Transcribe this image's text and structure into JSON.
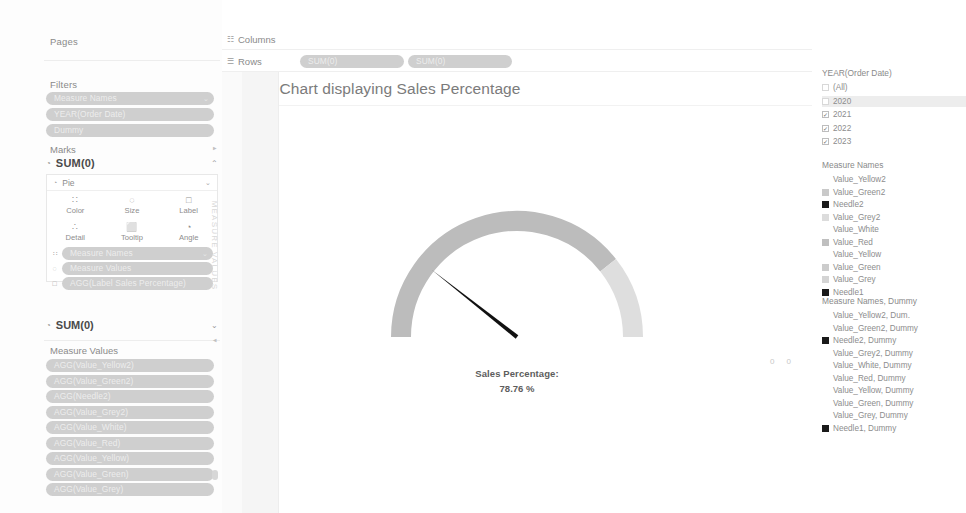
{
  "left_pane": {
    "pages": {
      "label": "Pages"
    },
    "filters": {
      "label": "Filters",
      "pills": [
        {
          "label": "Measure Names",
          "caret": "⌄"
        },
        {
          "label": "YEAR(Order Date)",
          "caret": ""
        },
        {
          "label": "Dummy",
          "caret": ""
        }
      ]
    },
    "marks": {
      "label": "Marks",
      "card_title": "SUM(0)",
      "card_icon": "◔",
      "collapse_caret": "⌃",
      "mark_type": {
        "icon": "◔",
        "label": "Pie",
        "caret": "⌄"
      },
      "buttons": [
        {
          "glyph": "∷",
          "label": "Color"
        },
        {
          "glyph": "◌",
          "label": "Size"
        },
        {
          "glyph": "□",
          "label": "Label"
        },
        {
          "glyph": "∴",
          "label": "Detail"
        },
        {
          "glyph": "⬜",
          "label": "Tooltip"
        },
        {
          "glyph": "◔",
          "label": "Angle"
        }
      ],
      "pills": [
        {
          "glyph": "∷",
          "label": "Measure Names",
          "caret": "⌄"
        },
        {
          "glyph": "◌",
          "label": "Measure Values",
          "caret": ""
        },
        {
          "glyph": "□",
          "label": "AGG(Label Sales Percentage)",
          "caret": ""
        }
      ]
    },
    "marks2": {
      "icon": "◔",
      "title": "SUM(0)",
      "caret": "⌄"
    },
    "measure_values": {
      "label": "Measure Values",
      "pills": [
        "AGG(Value_Yellow2)",
        "AGG(Value_Green2)",
        "AGG(Needle2)",
        "AGG(Value_Grey2)",
        "AGG(Value_White)",
        "AGG(Value_Red)",
        "AGG(Value_Yellow)",
        "AGG(Value_Green)",
        "AGG(Value_Grey)"
      ]
    },
    "vertical_strip": "MEASURE VALUES",
    "arrow_up": "▲",
    "arrow_down": "▼"
  },
  "shelves": {
    "columns": {
      "glyph": "☷",
      "label": "Columns",
      "pills": []
    },
    "rows": {
      "glyph": "☰",
      "label": "Rows",
      "pills": [
        "SUM(0)",
        "SUM(0)"
      ]
    }
  },
  "canvas": {
    "title": "Gauge Chart displaying Sales Percentage",
    "axis_left": "0 0",
    "axis_right": "0 0",
    "gauge_label_title": "Sales Percentage:",
    "gauge_label_value": "78.76 %"
  },
  "right_pane": {
    "year_filter": {
      "title": "YEAR(Order Date)",
      "items": [
        {
          "label": "(All)",
          "checked": false,
          "box": "blank",
          "highlight": false
        },
        {
          "label": "2020",
          "checked": false,
          "box": "blank",
          "highlight": true
        },
        {
          "label": "2021",
          "checked": true,
          "box": "check",
          "highlight": false
        },
        {
          "label": "2022",
          "checked": true,
          "box": "check",
          "highlight": false
        },
        {
          "label": "2023",
          "checked": true,
          "box": "check",
          "highlight": false
        }
      ],
      "check_glyph": "✓"
    },
    "legend_measure_names": {
      "title": "Measure Names",
      "items": [
        {
          "label": "Value_Yellow2",
          "color": "none",
          "indent": true
        },
        {
          "label": "Value_Green2",
          "color": "#c9c9c9",
          "indent": false
        },
        {
          "label": "Needle2",
          "color": "#1a1a1a",
          "indent": false
        },
        {
          "label": "Value_Grey2",
          "color": "#dcdcdc",
          "indent": false
        },
        {
          "label": "Value_White",
          "color": "none",
          "indent": true
        },
        {
          "label": "Value_Red",
          "color": "#bfbfbf",
          "indent": false
        },
        {
          "label": "Value_Yellow",
          "color": "none",
          "indent": true
        },
        {
          "label": "Value_Green",
          "color": "#cccccc",
          "indent": false
        },
        {
          "label": "Value_Grey",
          "color": "#d4d4d4",
          "indent": false
        },
        {
          "label": "Needle1",
          "color": "#1a1a1a",
          "indent": false
        }
      ]
    },
    "legend_measure_names_dummy": {
      "title": "Measure Names, Dummy",
      "items": [
        {
          "label": "Value_Yellow2, Dum.",
          "color": "none",
          "indent": true
        },
        {
          "label": "Value_Green2, Dummy",
          "color": "none",
          "indent": true
        },
        {
          "label": "Needle2, Dummy",
          "color": "#1a1a1a",
          "indent": false
        },
        {
          "label": "Value_Grey2, Dummy",
          "color": "none",
          "indent": true
        },
        {
          "label": "Value_White, Dummy",
          "color": "none",
          "indent": true
        },
        {
          "label": "Value_Red, Dummy",
          "color": "none",
          "indent": true
        },
        {
          "label": "Value_Yellow, Dummy",
          "color": "none",
          "indent": true
        },
        {
          "label": "Value_Green, Dummy",
          "color": "none",
          "indent": true
        },
        {
          "label": "Value_Grey, Dummy",
          "color": "none",
          "indent": true
        },
        {
          "label": "Needle1, Dummy",
          "color": "#1a1a1a",
          "indent": false
        }
      ]
    }
  },
  "chart_data": {
    "type": "pie",
    "title": "Gauge Chart displaying Sales Percentage",
    "subtitle": "",
    "xlabel": "",
    "ylabel": "",
    "gauge": {
      "value": 78.76,
      "unit": "%",
      "min": 0,
      "max": 100,
      "value_label": "78.76 %",
      "caption": "Sales Percentage:",
      "start_angle_deg": 180,
      "sweep_deg": 180,
      "needle_angle_deg": 141.8,
      "ring_thickness_px": 20,
      "colors": {
        "filled_arc": "#bcbcbc",
        "remainder_arc": "#dedede",
        "needle": "#111111"
      }
    },
    "series": [
      {
        "name": "Value_Grey",
        "value": 78.76,
        "color": "#bcbcbc"
      },
      {
        "name": "Value_Grey2",
        "value": 21.24,
        "color": "#dedede"
      },
      {
        "name": "Needle1",
        "value": 0.4,
        "color": "#111111"
      }
    ],
    "axis_ticks_left": "0 0",
    "axis_ticks_right": "0 0",
    "grid": false,
    "legend_position": "right"
  }
}
